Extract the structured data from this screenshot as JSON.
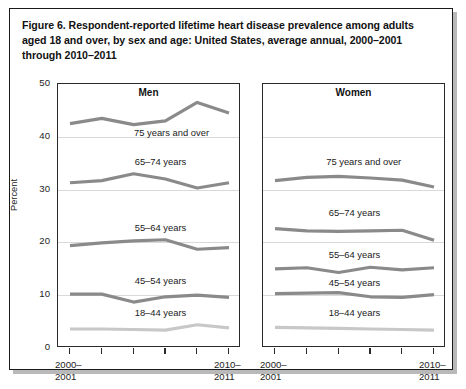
{
  "figure": {
    "title": "Figure 6. Respondent-reported lifetime heart disease prevalence among adults aged 18 and over, by sex and age: United States, average annual, 2000–2001 through 2010–2011",
    "ylabel": "Percent",
    "xtick_first_line1": "2000–",
    "xtick_first_line2": "2001",
    "xtick_last_line1": "2010–",
    "xtick_last_line2": "2011"
  },
  "colors": {
    "line_dark": "#8a8a8a",
    "line_light": "#c8c8c8",
    "gridline": "#d9d9d9",
    "axis": "#2a2a2a",
    "text": "#1a1a1a",
    "frame": "#1a1a1a",
    "background": "#ffffff"
  },
  "chart_data": {
    "type": "line",
    "title": "Figure 6. Respondent-reported lifetime heart disease prevalence among adults aged 18 and over, by sex and age: United States, average annual, 2000–2001 through 2010–2011",
    "xlabel": "",
    "ylabel": "Percent",
    "ylim": [
      0,
      50
    ],
    "yticks": [
      0,
      10,
      20,
      30,
      40,
      50
    ],
    "ytick_labels": [
      "0",
      "10",
      "20",
      "30",
      "40",
      "50"
    ],
    "grid": "horizontal",
    "legend": "inline-labels",
    "x": [
      "2000–2001",
      "2002–2003",
      "2004–2005",
      "2006–2007",
      "2008–2009",
      "2010–2011"
    ],
    "xtick_labels_shown": [
      "2000–2001",
      "",
      "",
      "",
      "",
      "2010–2011"
    ],
    "panels": [
      {
        "name": "men",
        "label": "Men",
        "series": [
          {
            "name": "75 years and over",
            "color": "#8a8a8a",
            "values": [
              42.5,
              43.5,
              42.3,
              43.0,
              46.5,
              44.5
            ]
          },
          {
            "name": "65–74 years",
            "color": "#8a8a8a",
            "values": [
              31.3,
              31.7,
              33.0,
              32.0,
              30.3,
              31.3
            ]
          },
          {
            "name": "55–64 years",
            "color": "#8a8a8a",
            "values": [
              19.4,
              19.9,
              20.3,
              20.5,
              18.7,
              19.0
            ]
          },
          {
            "name": "45–54 years",
            "color": "#8a8a8a",
            "values": [
              10.2,
              10.2,
              8.7,
              9.7,
              10.0,
              9.6
            ]
          },
          {
            "name": "18–44 years",
            "color": "#c8c8c8",
            "values": [
              3.6,
              3.6,
              3.5,
              3.4,
              4.4,
              3.8
            ]
          }
        ]
      },
      {
        "name": "women",
        "label": "Women",
        "series": [
          {
            "name": "75 years and over",
            "color": "#8a8a8a",
            "values": [
              31.7,
              32.3,
              32.5,
              32.2,
              31.8,
              30.5
            ]
          },
          {
            "name": "65–74 years",
            "color": "#8a8a8a",
            "values": [
              22.6,
              22.2,
              22.1,
              22.2,
              22.3,
              20.4
            ]
          },
          {
            "name": "55–64 years",
            "color": "#8a8a8a",
            "values": [
              15.0,
              15.2,
              14.3,
              15.3,
              14.8,
              15.2
            ]
          },
          {
            "name": "45–54 years",
            "color": "#8a8a8a",
            "values": [
              10.3,
              10.4,
              10.5,
              9.7,
              9.6,
              10.1
            ]
          },
          {
            "name": "18–44 years",
            "color": "#c8c8c8",
            "values": [
              3.9,
              3.8,
              3.7,
              3.6,
              3.5,
              3.4
            ]
          }
        ]
      }
    ],
    "series_label_positions": {
      "men": [
        {
          "name": "75 years and over",
          "x_frac": 0.62,
          "y_value": 40.8
        },
        {
          "name": "65–74 years",
          "x_frac": 0.56,
          "y_value": 35.3
        },
        {
          "name": "55–64 years",
          "x_frac": 0.56,
          "y_value": 22.8
        },
        {
          "name": "45–54 years",
          "x_frac": 0.56,
          "y_value": 12.7
        },
        {
          "name": "18–44 years",
          "x_frac": 0.56,
          "y_value": 6.6
        }
      ],
      "women": [
        {
          "name": "75 years and over",
          "x_frac": 0.55,
          "y_value": 35.3
        },
        {
          "name": "65–74 years",
          "x_frac": 0.5,
          "y_value": 25.6
        },
        {
          "name": "55–64 years",
          "x_frac": 0.5,
          "y_value": 17.6
        },
        {
          "name": "45–54 years",
          "x_frac": 0.5,
          "y_value": 12.3
        },
        {
          "name": "18–44 years",
          "x_frac": 0.5,
          "y_value": 6.6
        }
      ]
    }
  }
}
